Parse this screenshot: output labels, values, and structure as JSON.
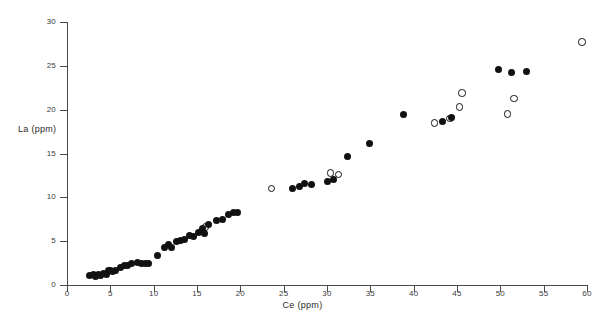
{
  "chart_data": {
    "type": "scatter",
    "title": "",
    "xlabel": "Ce (ppm)",
    "ylabel": "La (ppm)",
    "xlim": [
      0,
      60
    ],
    "ylim": [
      0,
      30
    ],
    "xticks": [
      0,
      5,
      10,
      15,
      20,
      25,
      30,
      35,
      40,
      45,
      50,
      55,
      60
    ],
    "yticks": [
      0,
      5,
      10,
      15,
      20,
      25,
      30
    ],
    "grid": false,
    "legend": "none",
    "marker_colors": {
      "filled": "#111111",
      "open": "#111111"
    },
    "series": [
      {
        "name": "filled-circles",
        "marker": "filled-circle",
        "points": [
          [
            2.6,
            1.1
          ],
          [
            3.0,
            1.2
          ],
          [
            3.3,
            1.0
          ],
          [
            3.6,
            1.2
          ],
          [
            3.9,
            1.1
          ],
          [
            4.2,
            1.3
          ],
          [
            4.5,
            1.2
          ],
          [
            4.8,
            1.6
          ],
          [
            5.0,
            1.7
          ],
          [
            5.2,
            1.5
          ],
          [
            5.6,
            1.6
          ],
          [
            6.2,
            2.0
          ],
          [
            6.6,
            2.2
          ],
          [
            7.0,
            2.2
          ],
          [
            7.4,
            2.5
          ],
          [
            8.1,
            2.6
          ],
          [
            8.6,
            2.4
          ],
          [
            9.0,
            2.4
          ],
          [
            9.4,
            2.4
          ],
          [
            10.4,
            3.4
          ],
          [
            11.2,
            4.3
          ],
          [
            11.7,
            4.6
          ],
          [
            12.1,
            4.3
          ],
          [
            12.6,
            5.0
          ],
          [
            13.1,
            5.1
          ],
          [
            13.6,
            5.2
          ],
          [
            14.1,
            5.6
          ],
          [
            14.6,
            5.5
          ],
          [
            15.2,
            6.0
          ],
          [
            15.6,
            6.5
          ],
          [
            15.9,
            5.9
          ],
          [
            16.3,
            6.9
          ],
          [
            17.2,
            7.4
          ],
          [
            17.9,
            7.5
          ],
          [
            18.6,
            8.0
          ],
          [
            19.2,
            8.3
          ],
          [
            19.7,
            8.3
          ],
          [
            26.0,
            11.0
          ],
          [
            26.8,
            11.2
          ],
          [
            27.4,
            11.6
          ],
          [
            28.2,
            11.5
          ],
          [
            30.1,
            11.8
          ],
          [
            30.7,
            12.0
          ],
          [
            32.4,
            14.7
          ],
          [
            34.9,
            16.1
          ],
          [
            38.8,
            19.5
          ],
          [
            43.3,
            18.7
          ],
          [
            44.4,
            19.1
          ],
          [
            49.8,
            24.6
          ],
          [
            51.3,
            24.2
          ],
          [
            53.0,
            24.4
          ]
        ]
      },
      {
        "name": "open-circles",
        "marker": "open-circle",
        "points": [
          [
            16.0,
            6.6
          ],
          [
            23.6,
            11.0
          ],
          [
            30.4,
            12.8
          ],
          [
            31.3,
            12.6
          ],
          [
            42.4,
            18.5
          ],
          [
            44.2,
            19.0
          ],
          [
            45.6,
            21.9
          ],
          [
            45.3,
            20.3
          ],
          [
            50.8,
            19.5
          ],
          [
            51.6,
            21.3
          ],
          [
            59.4,
            27.7
          ]
        ]
      }
    ]
  },
  "axes": {
    "x": {
      "label": "Ce (ppm)",
      "tick_labels": [
        "0",
        "5",
        "10",
        "15",
        "20",
        "25",
        "30",
        "35",
        "40",
        "45",
        "50",
        "55",
        "60"
      ]
    },
    "y": {
      "label": "La (ppm)",
      "tick_labels": [
        "0",
        "5",
        "10",
        "15",
        "20",
        "25",
        "30"
      ]
    }
  }
}
